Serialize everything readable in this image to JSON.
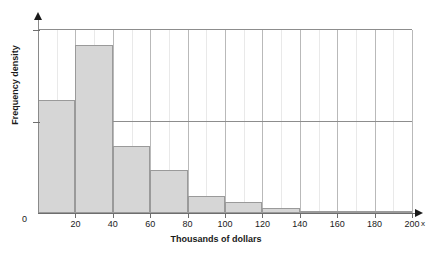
{
  "chart_data": {
    "type": "bar",
    "title": "",
    "subtitle": "",
    "xlabel": "Thousands of dollars",
    "ylabel": "Frequency density",
    "x_axis_variable": "x",
    "origin_label": "0",
    "xlim": [
      0,
      200
    ],
    "ylim": [
      0,
      1.0
    ],
    "xticks": [
      0,
      20,
      40,
      60,
      80,
      100,
      120,
      140,
      160,
      180,
      200
    ],
    "xtick_labels": [
      "0",
      "20",
      "40",
      "60",
      "80",
      "100",
      "120",
      "140",
      "160",
      "180",
      "200"
    ],
    "ytick_labels": [],
    "grid": "vertical minor every 10, major at labelled ticks; two horizontal rules",
    "legend": "none",
    "bin_width": 20,
    "bin_edges": [
      0,
      20,
      40,
      60,
      80,
      100,
      120,
      140,
      160,
      180,
      200
    ],
    "categories": [
      "0-20",
      "20-40",
      "40-60",
      "60-80",
      "80-100",
      "100-120",
      "120-140",
      "140-160",
      "160-180",
      "180-200"
    ],
    "values": [
      0.617,
      0.918,
      0.366,
      0.235,
      0.093,
      0.06,
      0.027,
      0.011,
      0.005,
      0.003
    ],
    "annotations": [],
    "colors": {
      "bar_fill": "#d6d6d6",
      "bar_edge": "#9a9a9a",
      "axis": "#6e6e6e",
      "grid_minor": "#e9e9e9",
      "grid_major": "#b9b9b9",
      "rule": "#8d8d8d",
      "text": "#1a1a1a",
      "background": "#ffffff"
    }
  },
  "rules": {
    "top": 1.0,
    "middle": 0.5
  }
}
